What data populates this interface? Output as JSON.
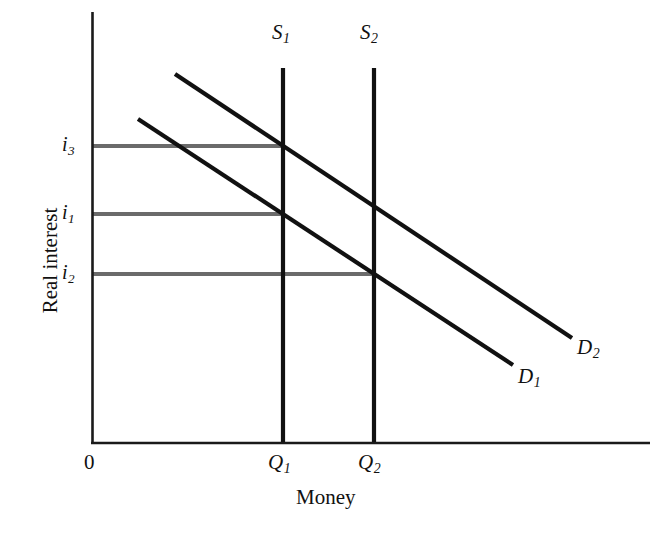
{
  "figure": {
    "background_color": "#ffffff",
    "axis_color": "#1a1a1a",
    "curve_color": "#111111",
    "guide_color": "#6b6b6b",
    "origin_label": "0",
    "x_axis_title": "Money",
    "y_axis_title": "Real interest"
  },
  "labels": {
    "supply_1": {
      "base": "S",
      "sub": "1"
    },
    "supply_2": {
      "base": "S",
      "sub": "2"
    },
    "demand_1": {
      "base": "D",
      "sub": "1"
    },
    "demand_2": {
      "base": "D",
      "sub": "2"
    },
    "interest_1": {
      "base": "i",
      "sub": "1"
    },
    "interest_2": {
      "base": "i",
      "sub": "2"
    },
    "interest_3": {
      "base": "i",
      "sub": "3"
    },
    "quantity_1": {
      "base": "Q",
      "sub": "1"
    },
    "quantity_2": {
      "base": "Q",
      "sub": "2"
    }
  },
  "chart_data": {
    "type": "line",
    "title": "",
    "subtitle": "",
    "xlabel": "Money",
    "ylabel": "Real interest",
    "grid": false,
    "legend": "inline-endpoint-labels",
    "axes": {
      "x_origin_label": "0",
      "x_ticks": [
        "Q1",
        "Q2"
      ],
      "y_ticks": [
        "i2",
        "i1",
        "i3"
      ],
      "x_tick_values": [
        283,
        374
      ],
      "y_tick_values": [
        274,
        214,
        146
      ],
      "x_range_px": [
        92,
        650
      ],
      "y_range_px": [
        12,
        443
      ],
      "note": "Axis values are qualitative; tick positions given in figure pixel coordinates."
    },
    "series": [
      {
        "name": "D1",
        "role": "money demand curve (lower)",
        "type": "line",
        "points_px": [
          [
            138,
            119
          ],
          [
            513,
            365
          ]
        ],
        "label": "D1",
        "label_pos_px": [
          520,
          372
        ]
      },
      {
        "name": "D2",
        "role": "money demand curve (upper, shifted right)",
        "type": "line",
        "points_px": [
          [
            175,
            74
          ],
          [
            572,
            338
          ]
        ],
        "label": "D2",
        "label_pos_px": [
          578,
          344
        ]
      },
      {
        "name": "S1",
        "role": "money supply, vertical",
        "type": "vline",
        "x_px": 283,
        "points_px": [
          [
            283,
            68
          ],
          [
            283,
            443
          ]
        ],
        "label": "S1",
        "label_pos_px": [
          274,
          28
        ]
      },
      {
        "name": "S2",
        "role": "money supply, vertical (larger)",
        "type": "vline",
        "x_px": 374,
        "points_px": [
          [
            374,
            68
          ],
          [
            374,
            443
          ]
        ],
        "label": "S2",
        "label_pos_px": [
          362,
          28
        ]
      }
    ],
    "guides": [
      {
        "name": "i3-guide",
        "y_px": 146,
        "x_from_px": 92,
        "x_to_px": 283,
        "label": "i3"
      },
      {
        "name": "i1-guide",
        "y_px": 214,
        "x_from_px": 92,
        "x_to_px": 283,
        "label": "i1"
      },
      {
        "name": "i2-guide",
        "y_px": 274,
        "x_from_px": 92,
        "x_to_px": 374,
        "label": "i2"
      }
    ],
    "equilibria": [
      {
        "name": "D2 x S1",
        "x": "Q1",
        "y": "i3",
        "px": [
          283,
          146
        ]
      },
      {
        "name": "D1 x S1",
        "x": "Q1",
        "y": "i1",
        "px": [
          283,
          214
        ]
      },
      {
        "name": "D2 x S2",
        "x": "Q2",
        "y": "i1",
        "px": [
          374,
          214
        ]
      },
      {
        "name": "D1 x S2",
        "x": "Q2",
        "y": "i2",
        "px": [
          374,
          274
        ]
      }
    ]
  }
}
